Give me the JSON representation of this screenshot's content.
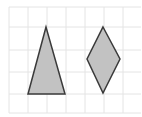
{
  "figure": {
    "grid": {
      "color": "#e4e4e4",
      "vertical_lines_x": [
        9,
        28,
        47,
        66,
        85,
        104,
        123
      ],
      "horizontal_lines_y": [
        7,
        27,
        50,
        72,
        94,
        113
      ],
      "x_extent": [
        9,
        141
      ],
      "y_extent": [
        7,
        113
      ]
    },
    "shapes": [
      {
        "name": "isosceles-triangle",
        "fill": "#c2c2c2",
        "stroke": "#3a3a3a",
        "points": [
          [
            46,
            27
          ],
          [
            28,
            94
          ],
          [
            65,
            94
          ]
        ]
      },
      {
        "name": "rhombus",
        "fill": "#c2c2c2",
        "stroke": "#3a3a3a",
        "points": [
          [
            103,
            27
          ],
          [
            120,
            59
          ],
          [
            103,
            93
          ],
          [
            87,
            59
          ]
        ]
      }
    ]
  }
}
